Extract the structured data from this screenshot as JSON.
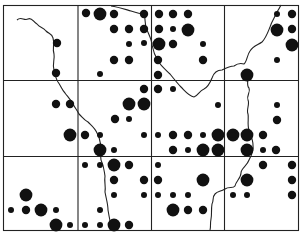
{
  "map": {
    "title": "",
    "colors": {
      "ink": "#111111",
      "paper": "#ffffff"
    },
    "grid": {
      "columns": 4,
      "rows": 3
    },
    "legend": {
      "dot_sizes": [
        "small",
        "medium",
        "large"
      ]
    },
    "dots": [
      {
        "cell": "r0c0",
        "size": "medium",
        "pos": [
          57,
          43
        ]
      },
      {
        "cell": "r0c0",
        "size": "medium",
        "pos": [
          56,
          73
        ]
      },
      {
        "cell": "r0c1",
        "size": "medium",
        "pos": [
          86,
          13
        ]
      },
      {
        "cell": "r0c1",
        "size": "large",
        "pos": [
          100,
          14
        ]
      },
      {
        "cell": "r0c1",
        "size": "medium",
        "pos": [
          114,
          14
        ]
      },
      {
        "cell": "r0c1",
        "size": "medium",
        "pos": [
          144,
          14
        ]
      },
      {
        "cell": "r0c1",
        "size": "medium",
        "pos": [
          114,
          29
        ]
      },
      {
        "cell": "r0c1",
        "size": "medium",
        "pos": [
          129,
          29
        ]
      },
      {
        "cell": "r0c1",
        "size": "medium",
        "pos": [
          144,
          29
        ]
      },
      {
        "cell": "r0c1",
        "size": "small",
        "pos": [
          129,
          44
        ]
      },
      {
        "cell": "r0c1",
        "size": "small",
        "pos": [
          144,
          43
        ]
      },
      {
        "cell": "r0c1",
        "size": "medium",
        "pos": [
          114,
          60
        ]
      },
      {
        "cell": "r0c1",
        "size": "medium",
        "pos": [
          129,
          60
        ]
      },
      {
        "cell": "r0c1",
        "size": "small",
        "pos": [
          100,
          74
        ]
      },
      {
        "cell": "r0c2",
        "size": "medium",
        "pos": [
          159,
          14
        ]
      },
      {
        "cell": "r0c2",
        "size": "medium",
        "pos": [
          173,
          14
        ]
      },
      {
        "cell": "r0c2",
        "size": "medium",
        "pos": [
          188,
          14
        ]
      },
      {
        "cell": "r0c2",
        "size": "medium",
        "pos": [
          159,
          29
        ]
      },
      {
        "cell": "r0c2",
        "size": "small",
        "pos": [
          173,
          29
        ]
      },
      {
        "cell": "r0c2",
        "size": "large",
        "pos": [
          188,
          30
        ]
      },
      {
        "cell": "r0c2",
        "size": "large",
        "pos": [
          159,
          44
        ]
      },
      {
        "cell": "r0c2",
        "size": "medium",
        "pos": [
          173,
          44
        ]
      },
      {
        "cell": "r0c2",
        "size": "small",
        "pos": [
          203,
          44
        ]
      },
      {
        "cell": "r0c2",
        "size": "medium",
        "pos": [
          158,
          60
        ]
      },
      {
        "cell": "r0c2",
        "size": "medium",
        "pos": [
          203,
          60
        ]
      },
      {
        "cell": "r0c2",
        "size": "medium",
        "pos": [
          158,
          75
        ]
      },
      {
        "cell": "r0c3",
        "size": "small",
        "pos": [
          277,
          14
        ]
      },
      {
        "cell": "r0c3",
        "size": "medium",
        "pos": [
          292,
          14
        ]
      },
      {
        "cell": "r0c3",
        "size": "large",
        "pos": [
          277,
          30
        ]
      },
      {
        "cell": "r0c3",
        "size": "medium",
        "pos": [
          292,
          29
        ]
      },
      {
        "cell": "r0c3",
        "size": "large",
        "pos": [
          292,
          45
        ]
      },
      {
        "cell": "r0c3",
        "size": "small",
        "pos": [
          277,
          60
        ]
      },
      {
        "cell": "r0c3",
        "size": "large",
        "pos": [
          247,
          75
        ]
      },
      {
        "cell": "r1c0",
        "size": "medium",
        "pos": [
          56,
          104
        ]
      },
      {
        "cell": "r1c0",
        "size": "medium",
        "pos": [
          70,
          104
        ]
      },
      {
        "cell": "r1c0",
        "size": "large",
        "pos": [
          70,
          135
        ]
      },
      {
        "cell": "r1c1",
        "size": "medium",
        "pos": [
          144,
          89
        ]
      },
      {
        "cell": "r1c1",
        "size": "large",
        "pos": [
          129,
          104
        ]
      },
      {
        "cell": "r1c1",
        "size": "large",
        "pos": [
          144,
          104
        ]
      },
      {
        "cell": "r1c1",
        "size": "medium",
        "pos": [
          115,
          119
        ]
      },
      {
        "cell": "r1c1",
        "size": "small",
        "pos": [
          129,
          119
        ]
      },
      {
        "cell": "r1c1",
        "size": "medium",
        "pos": [
          85,
          135
        ]
      },
      {
        "cell": "r1c1",
        "size": "small",
        "pos": [
          100,
          135
        ]
      },
      {
        "cell": "r1c1",
        "size": "small",
        "pos": [
          144,
          135
        ]
      },
      {
        "cell": "r1c1",
        "size": "large",
        "pos": [
          100,
          150
        ]
      },
      {
        "cell": "r1c1",
        "size": "small",
        "pos": [
          114,
          150
        ]
      },
      {
        "cell": "r1c2",
        "size": "medium",
        "pos": [
          158,
          89
        ]
      },
      {
        "cell": "r1c2",
        "size": "small",
        "pos": [
          173,
          89
        ]
      },
      {
        "cell": "r1c2",
        "size": "small",
        "pos": [
          218,
          105
        ]
      },
      {
        "cell": "r1c2",
        "size": "small",
        "pos": [
          158,
          135
        ]
      },
      {
        "cell": "r1c2",
        "size": "medium",
        "pos": [
          173,
          135
        ]
      },
      {
        "cell": "r1c2",
        "size": "medium",
        "pos": [
          188,
          135
        ]
      },
      {
        "cell": "r1c2",
        "size": "small",
        "pos": [
          203,
          135
        ]
      },
      {
        "cell": "r1c2",
        "size": "large",
        "pos": [
          218,
          135
        ]
      },
      {
        "cell": "r1c2",
        "size": "large",
        "pos": [
          233,
          135
        ]
      },
      {
        "cell": "r1c2",
        "size": "medium",
        "pos": [
          173,
          150
        ]
      },
      {
        "cell": "r1c2",
        "size": "small",
        "pos": [
          188,
          150
        ]
      },
      {
        "cell": "r1c2",
        "size": "large",
        "pos": [
          203,
          150
        ]
      },
      {
        "cell": "r1c2",
        "size": "large",
        "pos": [
          218,
          150
        ]
      },
      {
        "cell": "r1c3",
        "size": "small",
        "pos": [
          233,
          135
        ]
      },
      {
        "cell": "r1c3",
        "size": "large",
        "pos": [
          247,
          135
        ]
      },
      {
        "cell": "r1c3",
        "size": "medium",
        "pos": [
          263,
          135
        ]
      },
      {
        "cell": "r1c3",
        "size": "small",
        "pos": [
          277,
          105
        ]
      },
      {
        "cell": "r1c3",
        "size": "medium",
        "pos": [
          277,
          120
        ]
      },
      {
        "cell": "r1c3",
        "size": "large",
        "pos": [
          247,
          150
        ]
      },
      {
        "cell": "r1c3",
        "size": "small",
        "pos": [
          263,
          150
        ]
      },
      {
        "cell": "r1c3",
        "size": "medium",
        "pos": [
          276,
          150
        ]
      },
      {
        "cell": "r2c0",
        "size": "large",
        "pos": [
          26,
          195
        ]
      },
      {
        "cell": "r2c0",
        "size": "small",
        "pos": [
          11,
          210
        ]
      },
      {
        "cell": "r2c0",
        "size": "medium",
        "pos": [
          26,
          210
        ]
      },
      {
        "cell": "r2c0",
        "size": "large",
        "pos": [
          41,
          210
        ]
      },
      {
        "cell": "r2c0",
        "size": "small",
        "pos": [
          56,
          210
        ]
      },
      {
        "cell": "r2c0",
        "size": "large",
        "pos": [
          56,
          225
        ]
      },
      {
        "cell": "r2c0",
        "size": "small",
        "pos": [
          70,
          225
        ]
      },
      {
        "cell": "r2c1",
        "size": "small",
        "pos": [
          85,
          165
        ]
      },
      {
        "cell": "r2c1",
        "size": "small",
        "pos": [
          100,
          165
        ]
      },
      {
        "cell": "r2c1",
        "size": "large",
        "pos": [
          114,
          165
        ]
      },
      {
        "cell": "r2c1",
        "size": "medium",
        "pos": [
          129,
          165
        ]
      },
      {
        "cell": "r2c1",
        "size": "medium",
        "pos": [
          114,
          180
        ]
      },
      {
        "cell": "r2c1",
        "size": "medium",
        "pos": [
          144,
          180
        ]
      },
      {
        "cell": "r2c1",
        "size": "small",
        "pos": [
          114,
          195
        ]
      },
      {
        "cell": "r2c1",
        "size": "small",
        "pos": [
          144,
          195
        ]
      },
      {
        "cell": "r2c1",
        "size": "small",
        "pos": [
          100,
          210
        ]
      },
      {
        "cell": "r2c1",
        "size": "small",
        "pos": [
          85,
          225
        ]
      },
      {
        "cell": "r2c1",
        "size": "small",
        "pos": [
          100,
          225
        ]
      },
      {
        "cell": "r2c1",
        "size": "large",
        "pos": [
          114,
          225
        ]
      },
      {
        "cell": "r2c1",
        "size": "medium",
        "pos": [
          129,
          225
        ]
      },
      {
        "cell": "r2c2",
        "size": "small",
        "pos": [
          158,
          165
        ]
      },
      {
        "cell": "r2c2",
        "size": "medium",
        "pos": [
          158,
          180
        ]
      },
      {
        "cell": "r2c2",
        "size": "large",
        "pos": [
          203,
          180
        ]
      },
      {
        "cell": "r2c2",
        "size": "small",
        "pos": [
          158,
          195
        ]
      },
      {
        "cell": "r2c2",
        "size": "small",
        "pos": [
          188,
          195
        ]
      },
      {
        "cell": "r2c2",
        "size": "medium",
        "pos": [
          188,
          210
        ]
      },
      {
        "cell": "r2c2",
        "size": "medium",
        "pos": [
          203,
          210
        ]
      },
      {
        "cell": "r2c2",
        "size": "small",
        "pos": [
          173,
          195
        ]
      },
      {
        "cell": "r2c2",
        "size": "large",
        "pos": [
          173,
          210
        ]
      },
      {
        "cell": "r2c3",
        "size": "medium",
        "pos": [
          263,
          165
        ]
      },
      {
        "cell": "r2c3",
        "size": "medium",
        "pos": [
          292,
          165
        ]
      },
      {
        "cell": "r2c3",
        "size": "large",
        "pos": [
          247,
          180
        ]
      },
      {
        "cell": "r2c3",
        "size": "medium",
        "pos": [
          292,
          180
        ]
      },
      {
        "cell": "r2c3",
        "size": "small",
        "pos": [
          233,
          195
        ]
      },
      {
        "cell": "r2c3",
        "size": "small",
        "pos": [
          247,
          195
        ]
      },
      {
        "cell": "r2c3",
        "size": "medium",
        "pos": [
          292,
          195
        ]
      }
    ]
  }
}
